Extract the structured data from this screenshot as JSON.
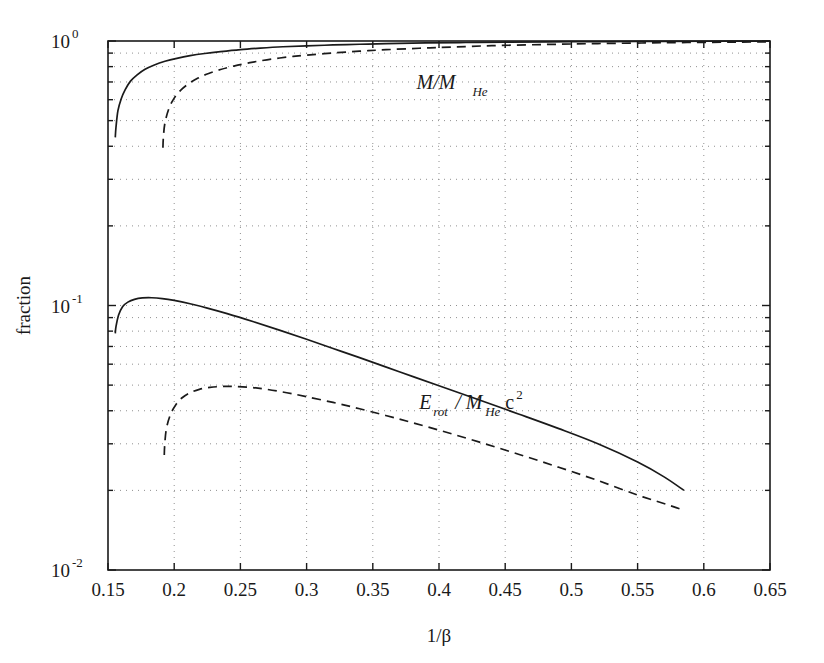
{
  "figure": {
    "background": "#ffffff",
    "ink": "#1a1a1a",
    "grid_color": "#909090"
  },
  "axes": {
    "x_label": "1/β",
    "y_label": "fraction",
    "x_ticks": [
      "0.15",
      "0.2",
      "0.25",
      "0.3",
      "0.35",
      "0.4",
      "0.45",
      "0.5",
      "0.55",
      "0.6",
      "0.65"
    ],
    "x_tick_values": [
      0.15,
      0.2,
      0.25,
      0.3,
      0.35,
      0.4,
      0.45,
      0.5,
      0.55,
      0.6,
      0.65
    ],
    "y_ticks": [
      {
        "base": "10",
        "exp": "0",
        "value": 1
      },
      {
        "base": "10",
        "exp": "-1",
        "value": 0.1
      },
      {
        "base": "10",
        "exp": "-2",
        "value": 0.01
      }
    ],
    "x_scale": "linear",
    "y_scale": "log",
    "xlim": [
      0.15,
      0.65
    ],
    "ylim": [
      0.01,
      1.0
    ],
    "grid": "dotted"
  },
  "annotations": [
    {
      "name": "mass-fraction-label",
      "text_main": "M/M",
      "text_sub": "He",
      "x": 0.383,
      "y": 0.66
    },
    {
      "name": "rotational-energy-label",
      "text_main": "E",
      "text_sub1": "rot",
      "text_mid": " / M",
      "text_sub2": "He",
      "text_tail": "c",
      "text_exp": "2",
      "x": 0.385,
      "y": 0.0405
    }
  ],
  "chart_data": {
    "type": "line",
    "title": "",
    "xlabel": "1/β",
    "ylabel": "fraction",
    "xlim": [
      0.15,
      0.65
    ],
    "ylim": [
      0.01,
      1.0
    ],
    "yscale": "log",
    "xscale": "linear",
    "grid": true,
    "legend": "inline-annotations",
    "series": [
      {
        "name": "M/M_He (solid)",
        "style": "solid",
        "color": "#1a1a1a",
        "x": [
          0.1555,
          0.156,
          0.1575,
          0.16,
          0.163,
          0.167,
          0.172,
          0.178,
          0.185,
          0.193,
          0.202,
          0.212,
          0.223,
          0.235,
          0.25,
          0.265,
          0.282,
          0.3,
          0.32,
          0.34,
          0.36,
          0.39,
          0.42,
          0.45,
          0.5,
          0.55,
          0.6,
          0.65
        ],
        "y": [
          0.432,
          0.47,
          0.545,
          0.605,
          0.655,
          0.705,
          0.745,
          0.782,
          0.812,
          0.838,
          0.86,
          0.88,
          0.897,
          0.912,
          0.928,
          0.94,
          0.951,
          0.959,
          0.966,
          0.972,
          0.977,
          0.983,
          0.987,
          0.99,
          0.994,
          0.996,
          0.998,
          0.999
        ]
      },
      {
        "name": "M/M_He (dashed)",
        "style": "dashed",
        "color": "#1a1a1a",
        "x": [
          0.1915,
          0.1918,
          0.193,
          0.196,
          0.2,
          0.205,
          0.211,
          0.218,
          0.226,
          0.235,
          0.245,
          0.257,
          0.27,
          0.285,
          0.3,
          0.32,
          0.34,
          0.36,
          0.385,
          0.41,
          0.44,
          0.48,
          0.52,
          0.57,
          0.62,
          0.65
        ],
        "y": [
          0.395,
          0.43,
          0.49,
          0.555,
          0.608,
          0.652,
          0.69,
          0.724,
          0.754,
          0.78,
          0.804,
          0.828,
          0.849,
          0.869,
          0.884,
          0.901,
          0.915,
          0.927,
          0.939,
          0.949,
          0.96,
          0.97,
          0.978,
          0.985,
          0.99,
          0.992
        ]
      },
      {
        "name": "E_rot/M_He c^2 (solid)",
        "style": "solid",
        "color": "#1a1a1a",
        "x": [
          0.1555,
          0.156,
          0.158,
          0.161,
          0.165,
          0.17,
          0.176,
          0.183,
          0.191,
          0.2,
          0.212,
          0.225,
          0.24,
          0.26,
          0.28,
          0.3,
          0.32,
          0.34,
          0.37,
          0.4,
          0.43,
          0.46,
          0.49,
          0.52,
          0.55,
          0.57,
          0.585
        ],
        "y": [
          0.0785,
          0.083,
          0.092,
          0.099,
          0.103,
          0.1055,
          0.1068,
          0.107,
          0.1062,
          0.1045,
          0.1015,
          0.0978,
          0.0932,
          0.0868,
          0.0805,
          0.0745,
          0.0688,
          0.0635,
          0.0562,
          0.0497,
          0.044,
          0.0389,
          0.0343,
          0.03,
          0.0256,
          0.0225,
          0.02
        ]
      },
      {
        "name": "E_rot/M_He c^2 (dashed)",
        "style": "dashed",
        "color": "#1a1a1a",
        "x": [
          0.1925,
          0.1928,
          0.194,
          0.197,
          0.201,
          0.206,
          0.212,
          0.219,
          0.227,
          0.236,
          0.246,
          0.258,
          0.27,
          0.285,
          0.3,
          0.32,
          0.34,
          0.37,
          0.4,
          0.43,
          0.46,
          0.49,
          0.52,
          0.55,
          0.575,
          0.585
        ],
        "y": [
          0.0272,
          0.0295,
          0.034,
          0.0385,
          0.042,
          0.0448,
          0.0468,
          0.0482,
          0.049,
          0.0494,
          0.0494,
          0.049,
          0.0482,
          0.0468,
          0.0452,
          0.043,
          0.0407,
          0.0372,
          0.0338,
          0.0305,
          0.0274,
          0.0245,
          0.0218,
          0.0192,
          0.0175,
          0.0168
        ]
      }
    ]
  }
}
